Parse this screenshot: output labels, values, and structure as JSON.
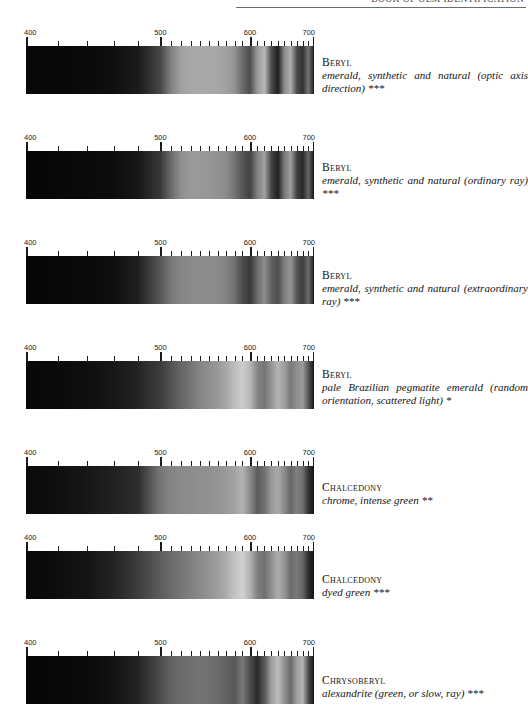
{
  "header": {
    "running_head": "BOOK OF GEM IDENTIFICATION"
  },
  "axis": {
    "unit": "nm",
    "labels": [
      "400",
      "500",
      "600",
      "700"
    ],
    "label_values": [
      400,
      500,
      600,
      700
    ],
    "range": [
      400,
      700
    ],
    "major_ticks": [
      400,
      500,
      600,
      700
    ],
    "minor_ticks": [
      420,
      440,
      460,
      480,
      510,
      520,
      530,
      540,
      550,
      560,
      570,
      580,
      590,
      610,
      620,
      630,
      640,
      650,
      660,
      670,
      680,
      690
    ]
  },
  "spectra": [
    {
      "mineral": "Beryl",
      "description": "emerald, synthetic and natural (optic axis direction) ***",
      "rating": "***"
    },
    {
      "mineral": "Beryl",
      "description": "emerald, synthetic and natural (ordinary ray) ***",
      "rating": "***"
    },
    {
      "mineral": "Beryl",
      "description": "emerald, synthetic and natural (extraordinary ray) ***",
      "rating": "***"
    },
    {
      "mineral": "Beryl",
      "description": "pale Brazilian pegmatite emerald (random orientation, scattered light) *",
      "rating": "*"
    },
    {
      "mineral": "Chalcedony",
      "description": "chrome, intense green **",
      "rating": "**"
    },
    {
      "mineral": "Chalcedony",
      "description": "dyed green ***",
      "rating": "***"
    },
    {
      "mineral": "Chrysoberyl",
      "description": "alexandrite (green, or slow, ray) ***",
      "rating": "***"
    }
  ],
  "chart_data": {
    "type": "heatmap",
    "xlabel": "Wavelength (nm)",
    "ylabel": "",
    "xlim": [
      400,
      700
    ],
    "grid": false,
    "legend": "none",
    "note": "Each row is a grayscale transmission strip: dark = absorption band, light = transmission. Values are relative transmission 0 (black) to 100 (white) sampled across 400-700 nm.",
    "x": [
      400,
      420,
      440,
      460,
      480,
      500,
      510,
      520,
      530,
      540,
      550,
      560,
      570,
      580,
      590,
      600,
      610,
      620,
      630,
      640,
      650,
      660,
      670,
      680,
      690,
      700
    ],
    "series": [
      {
        "name": "Beryl - emerald, synthetic and natural (optic axis direction)",
        "values": [
          3,
          3,
          4,
          6,
          10,
          28,
          50,
          63,
          66,
          66,
          66,
          65,
          63,
          58,
          42,
          30,
          60,
          72,
          30,
          12,
          55,
          68,
          30,
          20,
          46,
          10
        ]
      },
      {
        "name": "Beryl - emerald, synthetic and natural (ordinary ray)",
        "values": [
          2,
          3,
          4,
          5,
          9,
          22,
          42,
          56,
          60,
          60,
          59,
          57,
          54,
          46,
          34,
          26,
          50,
          63,
          27,
          13,
          48,
          62,
          26,
          16,
          40,
          8
        ]
      },
      {
        "name": "Beryl - emerald, synthetic and natural (extraordinary ray)",
        "values": [
          2,
          3,
          4,
          6,
          12,
          34,
          47,
          52,
          54,
          55,
          55,
          54,
          51,
          44,
          30,
          22,
          42,
          55,
          38,
          30,
          50,
          58,
          34,
          24,
          42,
          10
        ]
      },
      {
        "name": "Beryl - pale Brazilian pegmatite emerald (random orientation, scattered light)",
        "values": [
          3,
          4,
          6,
          9,
          14,
          24,
          32,
          40,
          46,
          52,
          56,
          60,
          66,
          74,
          80,
          72,
          52,
          46,
          58,
          70,
          62,
          48,
          56,
          60,
          34,
          8
        ]
      },
      {
        "name": "Chalcedony - chrome, intense green",
        "values": [
          4,
          6,
          9,
          13,
          18,
          46,
          52,
          54,
          55,
          56,
          57,
          58,
          60,
          64,
          70,
          54,
          36,
          44,
          60,
          66,
          54,
          40,
          50,
          44,
          20,
          8
        ]
      },
      {
        "name": "Chalcedony - dyed green",
        "values": [
          3,
          5,
          8,
          14,
          24,
          36,
          42,
          46,
          50,
          54,
          58,
          62,
          68,
          76,
          82,
          70,
          50,
          44,
          56,
          68,
          58,
          42,
          48,
          40,
          18,
          8
        ]
      },
      {
        "name": "Chrysoberyl - alexandrite (green, or slow, ray)",
        "values": [
          2,
          3,
          4,
          7,
          14,
          30,
          38,
          42,
          44,
          45,
          44,
          42,
          38,
          34,
          48,
          30,
          16,
          34,
          62,
          74,
          56,
          42,
          62,
          70,
          30,
          8
        ]
      }
    ]
  }
}
